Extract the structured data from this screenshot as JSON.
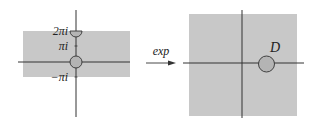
{
  "left_panel": {
    "labels": {
      "two_pi_i": "2πi",
      "pi_i": "πi",
      "minus_pi_i": "−πi"
    }
  },
  "arrow": {
    "label": "exp"
  },
  "right_panel": {
    "disk_label": "D"
  },
  "colors": {
    "region_fill": "#c8c8c8",
    "axis": "#333333",
    "disk_fill": "#b4b4b4"
  }
}
